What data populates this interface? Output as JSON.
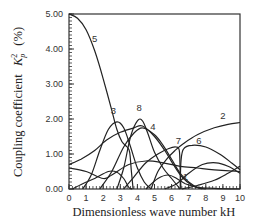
{
  "chart_data": {
    "type": "line",
    "title": "",
    "xlabel": "Dimensionless wave number kH",
    "ylabel": "Coupling coefficient",
    "ylabel_symbol": "K",
    "ylabel_sub": "p",
    "ylabel_sup": "2",
    "ylabel_unit": "(%)",
    "xlim": [
      0,
      10
    ],
    "ylim": [
      0,
      5
    ],
    "x_ticks": [
      "0",
      "1",
      "2",
      "3",
      "4",
      "5",
      "6",
      "7",
      "8",
      "9",
      "10"
    ],
    "y_ticks": [
      "0.00",
      "1.00",
      "2.00",
      "3.00",
      "4.00",
      "5.00"
    ],
    "grid": false,
    "legend": "inline curve labels",
    "series": [
      {
        "name": "5",
        "label_at": [
          1.5,
          4.2
        ],
        "points": [
          [
            0,
            5.0
          ],
          [
            0.5,
            4.88
          ],
          [
            1,
            4.55
          ],
          [
            1.5,
            3.95
          ],
          [
            2,
            3.15
          ],
          [
            2.5,
            2.25
          ],
          [
            2.8,
            1.7
          ],
          [
            3.1,
            1.35
          ],
          [
            3.4,
            1.2
          ],
          [
            3.55,
            1.05
          ],
          [
            3.65,
            0.5
          ],
          [
            3.75,
            0.0
          ]
        ]
      },
      {
        "name": "3",
        "label_at": [
          2.6,
          2.15
        ],
        "points": [
          [
            0.8,
            0.0
          ],
          [
            1.3,
            0.4
          ],
          [
            1.8,
            1.1
          ],
          [
            2.3,
            1.7
          ],
          [
            2.8,
            1.92
          ],
          [
            3.2,
            1.75
          ],
          [
            3.6,
            1.2
          ],
          [
            4.0,
            0.6
          ],
          [
            4.4,
            0.2
          ],
          [
            4.8,
            0.0
          ]
        ]
      },
      {
        "name": "8",
        "label_at": [
          4.1,
          2.22
        ],
        "points": [
          [
            2.8,
            0.0
          ],
          [
            3.2,
            0.6
          ],
          [
            3.6,
            1.5
          ],
          [
            4.0,
            1.95
          ],
          [
            4.3,
            1.95
          ],
          [
            4.6,
            1.6
          ],
          [
            5.0,
            1.05
          ],
          [
            5.5,
            0.6
          ],
          [
            6.0,
            0.3
          ],
          [
            6.5,
            0.0
          ]
        ]
      },
      {
        "name": "4",
        "label_at": [
          4.9,
          1.7
        ],
        "points": [
          [
            1.8,
            0.0
          ],
          [
            2.5,
            0.5
          ],
          [
            3.2,
            1.2
          ],
          [
            3.8,
            1.6
          ],
          [
            4.3,
            1.75
          ],
          [
            5.0,
            1.55
          ],
          [
            5.5,
            1.25
          ],
          [
            6.0,
            0.85
          ],
          [
            6.5,
            0.45
          ],
          [
            7.0,
            0.2
          ],
          [
            7.5,
            0.05
          ],
          [
            8.0,
            0.0
          ]
        ]
      },
      {
        "name": "2",
        "label_at": [
          9.0,
          2.0
        ],
        "points": [
          [
            4.8,
            0.0
          ],
          [
            5.2,
            0.5
          ],
          [
            5.7,
            0.85
          ],
          [
            6.2,
            1.1
          ],
          [
            6.7,
            1.3
          ],
          [
            7.5,
            1.55
          ],
          [
            8.5,
            1.75
          ],
          [
            9.3,
            1.85
          ],
          [
            10,
            1.9
          ]
        ]
      },
      {
        "name": "2-low-branch",
        "points": [
          [
            0,
            0.7
          ],
          [
            0.7,
            0.85
          ],
          [
            1.5,
            1.1
          ],
          [
            2.2,
            1.4
          ],
          [
            3.0,
            1.62
          ],
          [
            3.8,
            1.75
          ],
          [
            4.3,
            1.8
          ],
          [
            5.0,
            1.5
          ],
          [
            5.6,
            1.1
          ],
          [
            6.1,
            0.7
          ],
          [
            6.6,
            0.35
          ],
          [
            7.2,
            0.1
          ],
          [
            7.8,
            0.0
          ]
        ]
      },
      {
        "name": "7",
        "label_at": [
          6.4,
          1.28
        ],
        "points": [
          [
            3.2,
            0.0
          ],
          [
            3.8,
            0.35
          ],
          [
            4.5,
            0.75
          ],
          [
            5.2,
            1.0
          ],
          [
            5.8,
            1.15
          ],
          [
            6.25,
            1.2
          ],
          [
            6.45,
            1.1
          ],
          [
            6.5,
            0.5
          ],
          [
            6.55,
            0.0
          ]
        ]
      },
      {
        "name": "6",
        "label_at": [
          7.6,
          1.3
        ],
        "points": [
          [
            6.5,
            0.0
          ],
          [
            6.55,
            0.8
          ],
          [
            6.7,
            1.15
          ],
          [
            7.2,
            1.25
          ],
          [
            8.0,
            1.2
          ],
          [
            8.8,
            1.0
          ],
          [
            9.5,
            0.75
          ],
          [
            10,
            0.55
          ]
        ]
      },
      {
        "name": "1",
        "label_at": [
          6.8,
          0.25
        ],
        "points": [
          [
            4.5,
            0.0
          ],
          [
            5.2,
            0.3
          ],
          [
            5.8,
            0.4
          ],
          [
            6.3,
            0.3
          ],
          [
            6.8,
            0.15
          ],
          [
            7.5,
            0.05
          ],
          [
            8.5,
            0.02
          ],
          [
            10,
            0.0
          ]
        ]
      },
      {
        "name": "unlabeled-a",
        "points": [
          [
            0,
            0.6
          ],
          [
            1,
            0.5
          ],
          [
            2,
            0.3
          ],
          [
            2.5,
            0.4
          ],
          [
            3.5,
            0.7
          ],
          [
            4.5,
            0.8
          ],
          [
            5.5,
            0.75
          ],
          [
            6.5,
            0.65
          ],
          [
            7.5,
            0.6
          ],
          [
            8.5,
            0.55
          ],
          [
            10,
            0.5
          ]
        ]
      },
      {
        "name": "unlabeled-b",
        "points": [
          [
            0.2,
            0.0
          ],
          [
            0.8,
            0.15
          ],
          [
            1.5,
            0.3
          ],
          [
            2.3,
            0.5
          ],
          [
            2.8,
            0.48
          ],
          [
            3.2,
            0.3
          ],
          [
            3.5,
            0.05
          ],
          [
            3.7,
            0.0
          ]
        ]
      },
      {
        "name": "unlabeled-c",
        "points": [
          [
            5.6,
            0.0
          ],
          [
            6.3,
            0.15
          ],
          [
            7.0,
            0.45
          ],
          [
            7.8,
            0.7
          ],
          [
            8.6,
            0.75
          ],
          [
            9.3,
            0.65
          ],
          [
            10,
            0.45
          ]
        ]
      },
      {
        "name": "unlabeled-d",
        "points": [
          [
            6.6,
            0.0
          ],
          [
            7.5,
            0.1
          ],
          [
            8.5,
            0.25
          ],
          [
            9.3,
            0.45
          ],
          [
            10,
            0.65
          ]
        ]
      }
    ]
  }
}
